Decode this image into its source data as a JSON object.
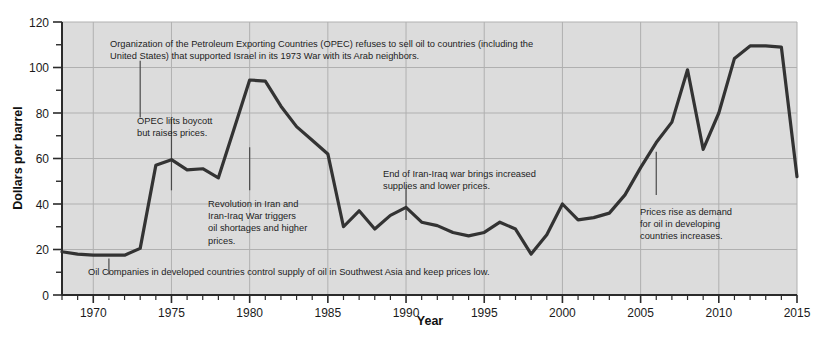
{
  "chart_data": {
    "type": "line",
    "title": "",
    "xlabel": "Year",
    "ylabel": "Dollars per barrel",
    "xlim": [
      1968,
      2015
    ],
    "ylim": [
      0,
      120
    ],
    "grid": true,
    "legend": "none",
    "y_ticks": [
      0,
      20,
      40,
      60,
      80,
      100,
      120
    ],
    "y_minor_ticks": [
      10,
      30,
      50,
      70,
      90,
      110
    ],
    "x_ticks": [
      1970,
      1975,
      1980,
      1985,
      1990,
      1995,
      2000,
      2005,
      2010,
      2015
    ],
    "x_tick_labels": [
      "1970",
      "1975",
      "1980",
      "1985",
      "1990",
      "1995",
      "2000",
      "2005",
      "2010",
      "2015"
    ],
    "y_tick_labels": [
      "0",
      "20",
      "40",
      "60",
      "80",
      "100",
      "120"
    ],
    "series": [
      {
        "name": "Crude oil price",
        "color": "#333333",
        "x": [
          1968,
          1969,
          1970,
          1971,
          1972,
          1973,
          1974,
          1975,
          1976,
          1977,
          1978,
          1979,
          1980,
          1981,
          1982,
          1983,
          1984,
          1985,
          1986,
          1987,
          1988,
          1989,
          1990,
          1991,
          1992,
          1993,
          1994,
          1995,
          1996,
          1997,
          1998,
          1999,
          2000,
          2001,
          2002,
          2003,
          2004,
          2005,
          2006,
          2007,
          2008,
          2009,
          2010,
          2011,
          2012,
          2013,
          2014,
          2015
        ],
        "values": [
          19,
          18,
          17.5,
          17.5,
          17.5,
          20.5,
          57,
          59.5,
          55,
          55.5,
          51.5,
          73,
          94.5,
          94,
          83,
          74,
          68,
          62,
          30,
          37,
          29,
          35,
          38.5,
          32,
          30.5,
          27.5,
          26,
          27.5,
          32,
          29,
          18,
          26.5,
          40,
          33,
          34,
          36,
          44,
          56,
          67,
          76,
          99,
          64,
          80,
          104,
          109.5,
          109.5,
          109,
          52
        ]
      }
    ],
    "annotations": [
      {
        "id": "opec-boycott",
        "lines": [
          "Organization of the Petroleum Exporting Countries (OPEC) refuses to sell oil to countries (including the",
          "United States) that supported Israel in its 1973 War with its Arab neighbors."
        ],
        "leader_year": 1973,
        "leader_top_value": 103,
        "leader_bottom_value": 78
      },
      {
        "id": "opec-lifts-boycott",
        "lines": [
          "OPEC lifts boycott",
          "but raises prices."
        ],
        "leader_year": 1975,
        "leader_top_value": 77,
        "leader_bottom_value": 46
      },
      {
        "id": "iran-revolution",
        "lines": [
          "Revolution in Iran and",
          "Iran-Iraq War triggers",
          "oil shortages and higher",
          "prices."
        ],
        "leader_year": 1980,
        "leader_top_value": 65,
        "leader_bottom_value": 46
      },
      {
        "id": "iran-iraq-war-end",
        "lines": [
          "End of Iran-Iraq war brings increased",
          "supplies and lower prices."
        ],
        "leader_year": 1990,
        "leader_top_value": 47,
        "leader_bottom_value": 33
      },
      {
        "id": "demand-developing-countries",
        "lines": [
          "Prices rise as demand",
          "for oil in developing",
          "countries increases."
        ],
        "leader_year": 2006,
        "leader_top_value": 63,
        "leader_bottom_value": 44
      },
      {
        "id": "oil-companies-control",
        "lines": [
          "Oil Companies in developed countries control supply of oil in Southwest Asia and keep prices low."
        ],
        "leader_year": 1971,
        "leader_top_value": 16,
        "leader_bottom_value": 9
      }
    ]
  },
  "style": {
    "plot_background": "#dcdcdc",
    "grid_color": "#b0b0b0",
    "axis_color": "#2b2b2b",
    "line_color": "#333333",
    "text_color": "#1c1c1c",
    "page_background": "#ffffff"
  }
}
